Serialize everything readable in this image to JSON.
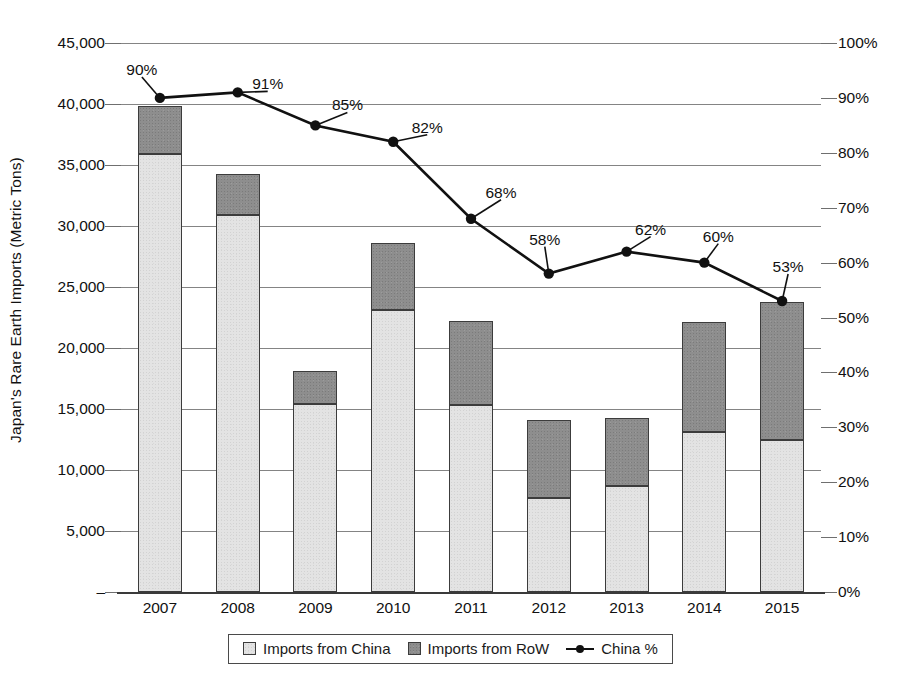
{
  "chart_data": {
    "type": "bar",
    "title": "",
    "xlabel": "",
    "ylabel": "Japan's Rare Earth Imports (Metric Tons)",
    "y2label": "",
    "categories": [
      "2007",
      "2008",
      "2009",
      "2010",
      "2011",
      "2012",
      "2013",
      "2014",
      "2015"
    ],
    "series": [
      {
        "name": "Imports from China",
        "type": "bar",
        "axis": "left",
        "values": [
          35900,
          30900,
          15400,
          23100,
          15300,
          7700,
          8700,
          13100,
          12500
        ]
      },
      {
        "name": "Imports from RoW",
        "type": "bar",
        "axis": "left",
        "values": [
          3900,
          3400,
          2700,
          5500,
          6900,
          6400,
          5600,
          9000,
          11300
        ]
      },
      {
        "name": "China %",
        "type": "line",
        "axis": "right",
        "values": [
          90,
          91,
          85,
          82,
          68,
          58,
          62,
          60,
          53
        ],
        "labels": [
          "90%",
          "91%",
          "85%",
          "82%",
          "68%",
          "58%",
          "62%",
          "60%",
          "53%"
        ]
      }
    ],
    "totals": [
      39800,
      34300,
      18100,
      28600,
      22200,
      14100,
      14300,
      22100,
      23800
    ],
    "ylim": [
      0,
      45000
    ],
    "y2lim": [
      0,
      100
    ],
    "yticks": [
      0,
      5000,
      10000,
      15000,
      20000,
      25000,
      30000,
      35000,
      40000,
      45000
    ],
    "ytick_labels": [
      "–",
      "5,000",
      "10,000",
      "15,000",
      "20,000",
      "25,000",
      "30,000",
      "35,000",
      "40,000",
      "45,000"
    ],
    "y2ticks": [
      0,
      10,
      20,
      30,
      40,
      50,
      60,
      70,
      80,
      90,
      100
    ],
    "y2tick_labels": [
      "0%",
      "10%",
      "20%",
      "30%",
      "40%",
      "50%",
      "60%",
      "70%",
      "80%",
      "90%",
      "100%"
    ],
    "grid": true,
    "legend_position": "bottom"
  },
  "legend": {
    "items": [
      {
        "label": "Imports from China",
        "marker": "square-light-swatch",
        "color": "#e3e3e3"
      },
      {
        "label": "Imports from RoW",
        "marker": "square-dark-swatch",
        "color": "#8e8e8e"
      },
      {
        "label": "China %",
        "marker": "line-with-dot-marker",
        "color": "#111111"
      }
    ]
  },
  "colors": {
    "china_fill": "#e3e3e3",
    "row_fill": "#8e8e8e",
    "bar_stroke": "#3c3c3c",
    "line": "#111111",
    "grid": "#6f6f6f",
    "axis": "#3a3a3a",
    "background": "#ffffff"
  }
}
